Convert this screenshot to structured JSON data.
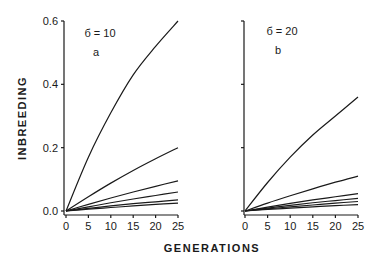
{
  "figure": {
    "ylabel": "INBREEDING",
    "xlabel": "GENERATIONS"
  },
  "chart_data": [
    {
      "type": "line",
      "panel": "a",
      "title": "б = 10",
      "panel_label": "a",
      "xlabel": "GENERATIONS",
      "ylabel": "INBREEDING",
      "xlim": [
        0,
        25
      ],
      "ylim": [
        0,
        0.6
      ],
      "xticks": [
        "0",
        "5",
        "10",
        "15",
        "20",
        "25"
      ],
      "yticks": [
        "0.0",
        "0.2",
        "0.4",
        "0.6"
      ],
      "grid": false,
      "legend": null,
      "x": [
        0,
        5,
        10,
        15,
        20,
        25
      ],
      "series": [
        {
          "name": "curve 1",
          "values": [
            0.0,
            0.17,
            0.31,
            0.43,
            0.52,
            0.6
          ]
        },
        {
          "name": "curve 2",
          "values": [
            0.0,
            0.045,
            0.088,
            0.128,
            0.165,
            0.2
          ]
        },
        {
          "name": "curve 3",
          "values": [
            0.0,
            0.021,
            0.041,
            0.06,
            0.078,
            0.095
          ]
        },
        {
          "name": "curve 4",
          "values": [
            0.0,
            0.013,
            0.026,
            0.038,
            0.049,
            0.06
          ]
        },
        {
          "name": "curve 5",
          "values": [
            0.0,
            0.008,
            0.016,
            0.023,
            0.029,
            0.035
          ]
        },
        {
          "name": "curve 6",
          "values": [
            0.0,
            0.006,
            0.011,
            0.016,
            0.021,
            0.025
          ]
        }
      ]
    },
    {
      "type": "line",
      "panel": "b",
      "title": "б = 20",
      "panel_label": "b",
      "xlabel": "GENERATIONS",
      "ylabel": "INBREEDING",
      "xlim": [
        0,
        25
      ],
      "ylim": [
        0,
        0.6
      ],
      "xticks": [
        "0",
        "5",
        "10",
        "15",
        "20",
        "25"
      ],
      "yticks": [
        "0.0",
        "0.2",
        "0.4",
        "0.6"
      ],
      "grid": false,
      "legend": null,
      "x": [
        0,
        5,
        10,
        15,
        20,
        25
      ],
      "series": [
        {
          "name": "curve 1",
          "values": [
            0.0,
            0.09,
            0.17,
            0.24,
            0.3,
            0.36
          ]
        },
        {
          "name": "curve 2",
          "values": [
            0.0,
            0.025,
            0.048,
            0.07,
            0.091,
            0.11
          ]
        },
        {
          "name": "curve 3",
          "values": [
            0.0,
            0.012,
            0.024,
            0.035,
            0.045,
            0.055
          ]
        },
        {
          "name": "curve 4",
          "values": [
            0.0,
            0.009,
            0.018,
            0.026,
            0.033,
            0.04
          ]
        },
        {
          "name": "curve 5",
          "values": [
            0.0,
            0.007,
            0.013,
            0.019,
            0.025,
            0.03
          ]
        },
        {
          "name": "curve 6",
          "values": [
            0.0,
            0.005,
            0.009,
            0.013,
            0.017,
            0.02
          ]
        }
      ]
    }
  ]
}
